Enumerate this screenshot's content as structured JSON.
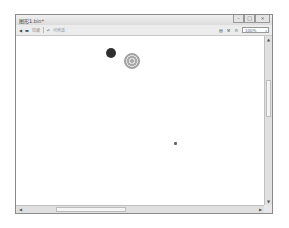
{
  "window": {
    "title": "图形1.bin*",
    "controls": {
      "minimize": "–",
      "maximize": "□",
      "close": "×"
    }
  },
  "toolbar": {
    "left": [
      {
        "name": "back-icon",
        "glyph": "◀"
      },
      {
        "name": "folder-icon",
        "glyph": "▬"
      },
      {
        "label": "隐藏"
      },
      {
        "name": "undo-icon",
        "glyph": "↶"
      },
      {
        "label": "可修改"
      }
    ],
    "right": [
      {
        "name": "print-icon",
        "glyph": "▤"
      },
      {
        "name": "tool-icon",
        "glyph": "⚒"
      },
      {
        "name": "settings-icon",
        "glyph": "⚙"
      }
    ],
    "zoom": {
      "value": "100%",
      "arrow": "▾"
    }
  },
  "canvas": {
    "shapes": [
      {
        "type": "dark-blob",
        "x": 105,
        "y": 34,
        "size": 10,
        "color": "#3a3a3a"
      },
      {
        "type": "patterned-circle",
        "x": 123,
        "y": 40,
        "size": 16,
        "color": "#9a9a9a"
      },
      {
        "type": "small-dot",
        "x": 173,
        "y": 128,
        "size": 3,
        "color": "#666666"
      }
    ]
  },
  "scrollbars": {
    "up": "▲",
    "down": "▼",
    "left": "◀",
    "right": "▶"
  }
}
